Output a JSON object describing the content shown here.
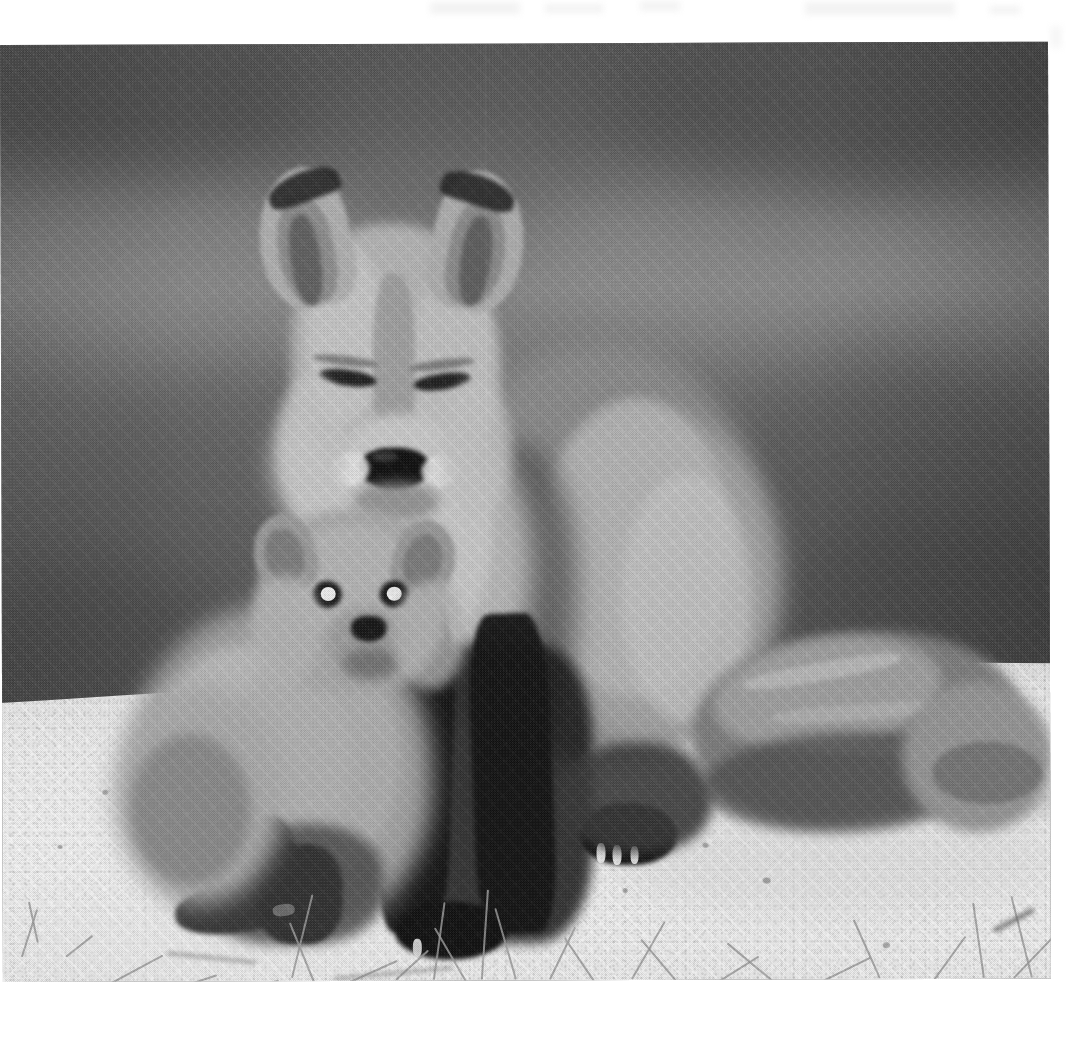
{
  "page": {
    "background_color": "#ffffff",
    "width": 1091,
    "height": 1042,
    "media_type": "scanned black-and-white photograph on a white page"
  },
  "photo": {
    "name": "red fox vixen with kit",
    "description": "Black and white photograph of an adult red fox sitting upright on a sandy mound with a young fox kit seated in front of and beneath it.",
    "tone": "monochrome / grayscale",
    "left": 0,
    "top": 45,
    "width": 1048,
    "height": 937,
    "palette": {
      "background_dark": "#565656",
      "background_mid": "#6e6e6e",
      "background_light_band": "#848484",
      "fur_light": "#cfcdc8",
      "fur_mid": "#9a9791",
      "fur_shadow": "#4a4845",
      "legs_black": "#1c1b1a",
      "nose_black": "#121110",
      "sand_light": "#efede8",
      "sand_mid": "#dedcd7",
      "grass_gray": "#8f8d86"
    },
    "subjects": [
      {
        "id": "adult-fox",
        "label": "Adult red fox (vixen)",
        "pose": "sitting upright, facing camera",
        "features": [
          "pointed ears with dark edging",
          "narrowed squinting eyes",
          "black nose",
          "pale muzzle and chest ruff",
          "dark slender forelegs",
          "long bushy tail curled to the right resting on sand"
        ]
      },
      {
        "id": "fox-kit",
        "label": "Fox kit (pup)",
        "pose": "sitting between the adult's forelegs, facing camera",
        "features": [
          "short rounded muzzle",
          "large bright round eyes",
          "small rounded ears",
          "dark forepaws on the sand"
        ]
      }
    ],
    "environment": [
      "blurred dark out-of-focus vegetation background",
      "pale sandy ground / dune ridge",
      "scattered dry grass stems in the foreground sand"
    ],
    "artifacts": {
      "halftone_screen": "visible 45-degree printing screen pattern",
      "vertical_seam": "faint vertical scan seam near the center",
      "top_margin_smudges": "faint gray bleed-through marks in the upper white margin",
      "edge_tilt": "print edge very slightly rotated"
    }
  }
}
